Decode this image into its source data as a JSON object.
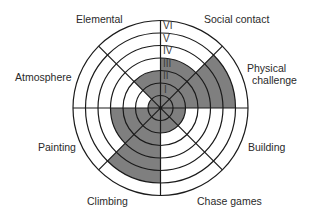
{
  "diagram": {
    "title": "",
    "center": [
      160.5,
      108
    ],
    "ring_radii": [
      12.5,
      25,
      37.5,
      50,
      62.5,
      75,
      87.5
    ],
    "band_radii": [
      12.5,
      25,
      37.5,
      50,
      62.5,
      75,
      87.5
    ],
    "colors": {
      "shaded": "#7f7f7f",
      "line": "#1a1a1a",
      "background": "#ffffff"
    },
    "levels": [
      "I",
      "II",
      "III",
      "IV",
      "V",
      "VI"
    ],
    "sectors": [
      {
        "name": "Social contact",
        "start_deg": 45,
        "end_deg": 90,
        "level": 4
      },
      {
        "name": "Physical challenge",
        "start_deg": 0,
        "end_deg": 45,
        "level": 6
      },
      {
        "name": "Building",
        "start_deg": -45,
        "end_deg": 0,
        "level": 2
      },
      {
        "name": "Chase games",
        "start_deg": -90,
        "end_deg": -45,
        "level": 2
      },
      {
        "name": "Climbing",
        "start_deg": -135,
        "end_deg": -90,
        "level": 6
      },
      {
        "name": "Painting",
        "start_deg": -180,
        "end_deg": -135,
        "level": 4
      },
      {
        "name": "Atmosphere",
        "start_deg": 135,
        "end_deg": 180,
        "level": 1
      },
      {
        "name": "Elemental",
        "start_deg": 90,
        "end_deg": 135,
        "level": 3
      }
    ]
  },
  "labels": {
    "social_contact": "Social contact",
    "physical_challenge_1": "Physical",
    "physical_challenge_2": "challenge",
    "building": "Building",
    "chase_games": "Chase games",
    "climbing": "Climbing",
    "painting": "Painting",
    "atmosphere": "Atmosphere",
    "elemental": "Elemental"
  },
  "level_labels": {
    "l1": "I",
    "l2": "II",
    "l3": "III",
    "l4": "IV",
    "l5": "V",
    "l6": "VI"
  }
}
